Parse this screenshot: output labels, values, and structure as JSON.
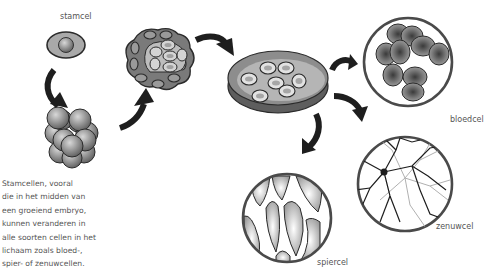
{
  "diagram": {
    "labels": {
      "stem_cell": "stamcel",
      "blood_cell": "bloedcel",
      "nerve_cell": "zenuwcel",
      "muscle_cell": "spiercel"
    },
    "caption_lines": [
      "Stamcellen, vooral",
      "die in het midden van",
      "een groeiend embryo,",
      "kunnen veranderen in",
      "alle soorten cellen in het",
      "lichaam zoals bloed-,",
      "spier- of zenuwcellen."
    ],
    "stages": [
      "stem-cell",
      "morula",
      "blastocyst",
      "culture-dish",
      "blood-cells",
      "nerve-cell",
      "muscle-cells"
    ],
    "colors": {
      "outline": "#2b2b2b",
      "cell_gray": "#8a8a8a",
      "light_gray": "#d0d0d0",
      "arrow": "#1e1e1e",
      "text": "#555555"
    }
  }
}
